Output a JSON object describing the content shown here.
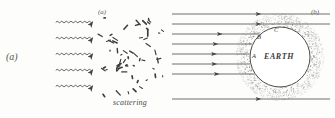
{
  "figure": {
    "label": "(a)",
    "domain_type": "scientific-diagram"
  },
  "panel_a": {
    "tag": "(a)",
    "caption": "scattering",
    "incoming_waves": {
      "count": 5,
      "style": "wavy-arrow",
      "direction": "rightward",
      "y_positions": [
        22,
        38,
        54,
        70,
        86
      ],
      "x_start": 56,
      "x_end": 98
    },
    "scatter_field": {
      "marker": "short-dash",
      "count": 58,
      "x_range": [
        100,
        163
      ],
      "y_range": [
        14,
        96
      ]
    }
  },
  "panel_b": {
    "tag": "(b)",
    "earth_label": "EARTH",
    "points": [
      {
        "id": "A",
        "x": 252,
        "y": 52
      },
      {
        "id": "B",
        "x": 257,
        "y": 33
      },
      {
        "id": "C",
        "x": 274,
        "y": 26
      }
    ],
    "incoming_rays": {
      "count": 8,
      "style": "straight-arrow",
      "direction": "rightward",
      "y_positions": [
        14,
        24,
        34,
        44,
        54,
        64,
        74,
        99
      ],
      "x_start": 172,
      "x_end": 330
    },
    "earth": {
      "center_x": 280,
      "center_y": 57,
      "radius": 30,
      "fill": "#ffffff",
      "stroke": "#4a4a4a"
    },
    "atmosphere": {
      "inner_radius": 30,
      "outer_radius": 44,
      "style": "stipple",
      "color": "#7a7a7a",
      "dot_count": 1400
    }
  },
  "colors": {
    "ink": "#3a3a3a",
    "line": "#555555",
    "stipple": "#7a7a7a",
    "page": "#fdfdfc"
  }
}
